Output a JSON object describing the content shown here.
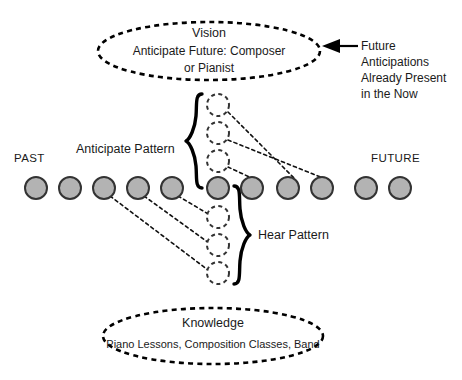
{
  "diagram": {
    "timeline": {
      "past_label": "PAST",
      "future_label": "FUTURE",
      "node_count": 11,
      "node_fill": "#b3b3b3",
      "node_stroke": "#333333"
    },
    "labels": {
      "anticipate_pattern": "Anticipate Pattern",
      "hear_pattern": "Hear Pattern"
    },
    "vision_ellipse": {
      "title": "Vision",
      "line1": "Anticipate Future: Composer",
      "line2": "or Pianist"
    },
    "knowledge_ellipse": {
      "title": "Knowledge",
      "line1": "Piano Lessons, Composition Classes, Band"
    },
    "annotation": {
      "line1": "Future",
      "line2": "Anticipations",
      "line3": "Already Present",
      "line4": "in the Now"
    },
    "anticipated_nodes": {
      "count": 3,
      "stroke": "#333333",
      "fill": "#ffffff"
    },
    "heard_nodes": {
      "count": 3,
      "stroke": "#333333",
      "fill": "#ffffff"
    },
    "colors": {
      "ink": "#1a1a1a",
      "line": "#000000",
      "node_fill": "#b3b3b3",
      "background": "#ffffff"
    }
  }
}
